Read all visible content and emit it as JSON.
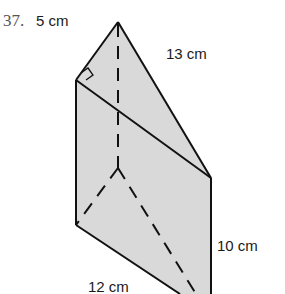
{
  "problem": {
    "number": "37.",
    "labels": {
      "top_edge": "5 cm",
      "hypotenuse": "13 cm",
      "height": "10 cm",
      "base_edge": "12 cm"
    },
    "colors": {
      "fill": "#d9d9d9",
      "stroke": "#111111"
    }
  }
}
